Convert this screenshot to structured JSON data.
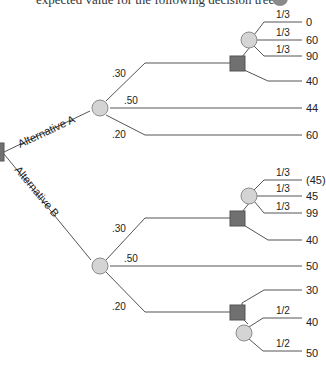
{
  "header": {
    "text": "expected value for the following decision tree."
  },
  "tree": {
    "alternatives": [
      {
        "label": "Alternative A",
        "branches": [
          {
            "prob": ".30",
            "decision": {
              "options": [
                {
                  "chance": [
                    {
                      "prob": "1/3",
                      "payoff": "0"
                    },
                    {
                      "prob": "1/3",
                      "payoff": "60"
                    },
                    {
                      "prob": "1/3",
                      "payoff": "90"
                    }
                  ]
                },
                {
                  "payoff": "40"
                }
              ]
            }
          },
          {
            "prob": ".50",
            "payoff": "44"
          },
          {
            "prob": ".20",
            "payoff": "60"
          }
        ]
      },
      {
        "label": "Alternative B",
        "branches": [
          {
            "prob": ".30",
            "decision": {
              "options": [
                {
                  "chance": [
                    {
                      "prob": "1/3",
                      "payoff": "(45)"
                    },
                    {
                      "prob": "1/3",
                      "payoff": "45"
                    },
                    {
                      "prob": "1/3",
                      "payoff": "99"
                    }
                  ]
                },
                {
                  "payoff": "40"
                }
              ]
            }
          },
          {
            "prob": ".50",
            "payoff": "50"
          },
          {
            "prob": ".20",
            "decision": {
              "options": [
                {
                  "payoff": "30"
                },
                {
                  "chance": [
                    {
                      "prob": "1/2",
                      "payoff": "40"
                    },
                    {
                      "prob": "1/2",
                      "payoff": "50"
                    }
                  ]
                }
              ]
            }
          }
        ]
      }
    ]
  },
  "colors": {
    "decision_node": "#707070",
    "chance_node": "#d4d4d4",
    "line": "#555555"
  }
}
